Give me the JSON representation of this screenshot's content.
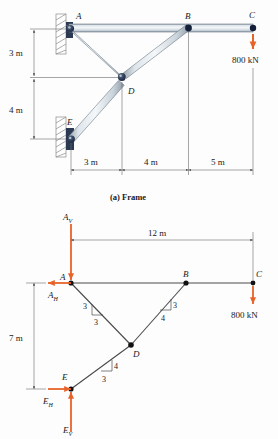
{
  "figure": {
    "caption_a": "(a) Frame",
    "load_label_top": "800 kN",
    "load_label_bottom": "800 kN"
  },
  "frame": {
    "joints": [
      {
        "id": "A",
        "label": "A"
      },
      {
        "id": "B",
        "label": "B"
      },
      {
        "id": "C",
        "label": "C"
      },
      {
        "id": "D",
        "label": "D"
      },
      {
        "id": "E",
        "label": "E"
      }
    ],
    "vertical_dims": [
      {
        "label": "3 m"
      },
      {
        "label": "4 m"
      }
    ],
    "horizontal_dims": [
      {
        "label": "3 m"
      },
      {
        "label": "4 m"
      },
      {
        "label": "5 m"
      }
    ]
  },
  "fbd": {
    "joints": [
      {
        "id": "A",
        "label": "A"
      },
      {
        "id": "B",
        "label": "B"
      },
      {
        "id": "C",
        "label": "C"
      },
      {
        "id": "D",
        "label": "D"
      },
      {
        "id": "E",
        "label": "E"
      }
    ],
    "reactions": [
      {
        "name": "A_V",
        "base": "A",
        "sub": "V"
      },
      {
        "name": "A_H",
        "base": "A",
        "sub": "H"
      },
      {
        "name": "E_H",
        "base": "E",
        "sub": "H"
      },
      {
        "name": "E_V",
        "base": "E",
        "sub": "V"
      }
    ],
    "span_label": "12 m",
    "height_label": "7 m",
    "slopes": [
      {
        "member": "AD",
        "rise": "3",
        "run": "3"
      },
      {
        "member": "BD",
        "rise": "3",
        "run": "4"
      },
      {
        "member": "DE",
        "rise": "4",
        "run": "3"
      }
    ]
  },
  "colors": {
    "load_arrow": "#e8622a",
    "member_dark": "#6d7a86",
    "member_light": "#eef2f5",
    "pin": "#2b3a52",
    "line": "#6b6b6b",
    "text": "#1a1a1a"
  }
}
